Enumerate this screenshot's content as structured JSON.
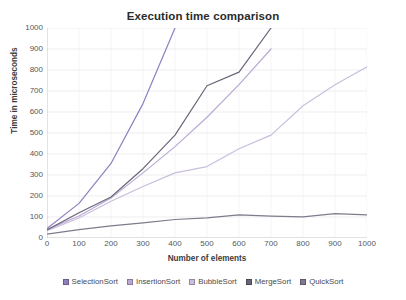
{
  "chart_data": {
    "type": "line",
    "title": "Execution time comparison",
    "xlabel": "Number of elements",
    "ylabel": "Time in microseconds",
    "xlim": [
      0,
      1000
    ],
    "ylim": [
      0,
      1000
    ],
    "grid": true,
    "legend_position": "bottom",
    "x_ticks": [
      0,
      100,
      200,
      300,
      400,
      500,
      600,
      700,
      800,
      900,
      1000
    ],
    "y_ticks": [
      0,
      100,
      200,
      300,
      400,
      500,
      600,
      700,
      800,
      900,
      1000
    ],
    "x": [
      0,
      100,
      200,
      300,
      400,
      500,
      600,
      700,
      800,
      900,
      1000
    ],
    "series": [
      {
        "name": "SelectionSort",
        "color": "#8f7fbf",
        "values": [
          45,
          165,
          355,
          640,
          1000,
          null,
          null,
          null,
          null,
          null,
          null
        ],
        "note": "exits top of plot near x=400"
      },
      {
        "name": "InsertionSort",
        "color": "#b9a9d6",
        "values": [
          40,
          105,
          190,
          310,
          435,
          575,
          730,
          900,
          null,
          null,
          null
        ],
        "note": "second steepest, clipped above 1000"
      },
      {
        "name": "BubbleSort",
        "color": "#c9bedd",
        "values": [
          35,
          95,
          175,
          245,
          310,
          340,
          425,
          490,
          630,
          730,
          815
        ],
        "note": "reaches about 815 at 1000 elements"
      },
      {
        "name": "MergeSort",
        "color": "#6b6478",
        "values": [
          38,
          120,
          195,
          330,
          490,
          725,
          790,
          1000,
          null,
          null,
          null
        ],
        "note": "exits top of plot near x=680"
      },
      {
        "name": "QuickSort",
        "color": "#807a8c",
        "values": [
          18,
          40,
          58,
          72,
          88,
          96,
          110,
          104,
          101,
          116,
          110
        ],
        "note": "flat cluster near 100 microseconds"
      }
    ]
  },
  "legend": {
    "items": [
      {
        "label": "SelectionSort",
        "color": "#8f7fbf"
      },
      {
        "label": "InsertionSort",
        "color": "#b9a9d6"
      },
      {
        "label": "BubbleSort",
        "color": "#c9bedd"
      },
      {
        "label": "MergeSort",
        "color": "#6b6478"
      },
      {
        "label": "QuickSort",
        "color": "#807a8c"
      }
    ]
  }
}
